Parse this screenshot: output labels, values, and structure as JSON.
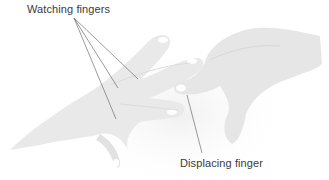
{
  "figure": {
    "labels": {
      "watching": "Watching fingers",
      "displacing": "Displacing finger"
    },
    "colors": {
      "background": "#ffffff",
      "skin": "#e9e9e9",
      "skin_shadow": "#d6d6d6",
      "nail": "#ffffff",
      "leader_line": "#6e6e6e",
      "text": "#3a3a3a",
      "glow": "#f3f3f3"
    }
  }
}
